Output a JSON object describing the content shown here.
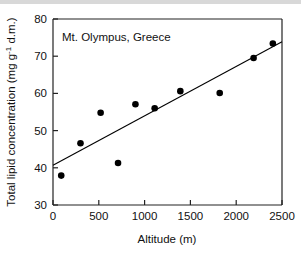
{
  "figure": {
    "background_color": "#ffffff",
    "frame_color": "#222222",
    "marker_color": "#000000",
    "line_color": "#000000"
  },
  "chart_data": {
    "type": "scatter",
    "title": "",
    "annotation": "Mt. Olympus, Greece",
    "xlabel": "Altitude (m)",
    "ylabel_prefix": "Total lipid concentration (mg g",
    "ylabel_superscript": "-1",
    "ylabel_suffix": " d.m.)",
    "ylabel_full": "Total lipid concentration (mg g-1 d.m.)",
    "xlim": [
      0,
      2500
    ],
    "ylim": [
      30,
      80
    ],
    "xticks": [
      0,
      500,
      1000,
      1500,
      2000,
      2500
    ],
    "xticklabels": [
      "0",
      "500",
      "1000",
      "1500",
      "2000",
      "2500"
    ],
    "yticks": [
      30,
      40,
      50,
      60,
      70,
      80
    ],
    "yticklabels": [
      "30",
      "40",
      "50",
      "60",
      "70",
      "80"
    ],
    "grid": false,
    "legend": "none",
    "x": [
      90,
      300,
      520,
      710,
      900,
      1110,
      1390,
      1820,
      2190,
      2400
    ],
    "y": [
      37.9,
      46.6,
      54.8,
      41.3,
      57.1,
      56.0,
      60.6,
      60.1,
      69.5,
      73.4
    ],
    "points": [
      {
        "x": 90,
        "y": 37.9
      },
      {
        "x": 300,
        "y": 46.6
      },
      {
        "x": 520,
        "y": 54.8
      },
      {
        "x": 710,
        "y": 41.3
      },
      {
        "x": 900,
        "y": 57.1
      },
      {
        "x": 1110,
        "y": 56.0
      },
      {
        "x": 1390,
        "y": 60.6
      },
      {
        "x": 1820,
        "y": 60.1
      },
      {
        "x": 2190,
        "y": 69.5
      },
      {
        "x": 2400,
        "y": 73.4
      }
    ],
    "series": [
      {
        "name": "Total lipid concentration",
        "values": [
          37.9,
          46.6,
          54.8,
          41.3,
          57.1,
          56.0,
          60.6,
          60.1,
          69.5,
          73.4
        ]
      }
    ],
    "fit_line": {
      "type": "linear-regression",
      "x_start": 0,
      "y_start": 40.7,
      "x_end": 2500,
      "y_end": 73.9
    }
  }
}
